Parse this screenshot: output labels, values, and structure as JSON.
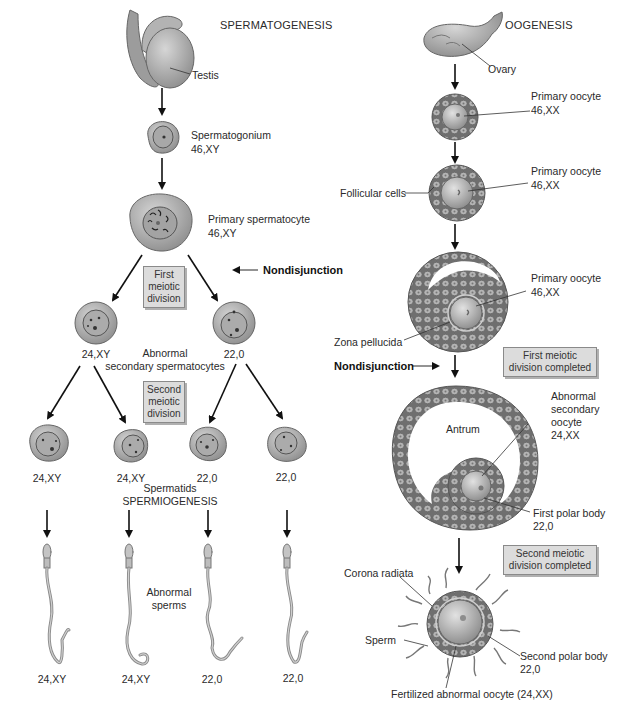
{
  "spermatogenesis": {
    "title": "SPERMATOGENESIS",
    "testis_label": "Testis",
    "spermatogonium": {
      "name": "Spermatogonium",
      "karyotype": "46,XY"
    },
    "primary_spermatocyte": {
      "name": "Primary spermatocyte",
      "karyotype": "46,XY"
    },
    "first_division_box": [
      "First",
      "meiotic",
      "division"
    ],
    "nondisjunction_label": "Nondisjunction",
    "secondary_spermatocytes": {
      "label_line1": "Abnormal",
      "label_line2": "secondary spermatocytes",
      "karyotypes": [
        "24,XY",
        "22,0"
      ]
    },
    "second_division_box": [
      "Second",
      "meiotic",
      "division"
    ],
    "spermatids": {
      "karyotypes": [
        "24,XY",
        "24,XY",
        "22,0",
        "22,0"
      ],
      "label": "Spermatids",
      "process_label": "SPERMIOGENESIS"
    },
    "sperms": {
      "label_line1": "Abnormal",
      "label_line2": "sperms",
      "karyotypes": [
        "24,XY",
        "24,XY",
        "22,0",
        "22,0"
      ]
    }
  },
  "oogenesis": {
    "title": "OOGENESIS",
    "ovary_label": "Ovary",
    "primary_oocyte_1": {
      "name": "Primary oocyte",
      "karyotype": "46,XX"
    },
    "primary_oocyte_2": {
      "name": "Primary oocyte",
      "karyotype": "46,XX"
    },
    "follicular_cells_label": "Follicular cells",
    "primary_oocyte_3": {
      "name": "Primary oocyte",
      "karyotype": "46,XX"
    },
    "zona_pellucida_label": "Zona pellucida",
    "nondisjunction_label": "Nondisjunction",
    "first_division_box": [
      "First meiotic",
      "division completed"
    ],
    "antrum_label": "Antrum",
    "secondary_oocyte": {
      "line1": "Abnormal",
      "line2": "secondary",
      "line3": "oocyte",
      "karyotype": "24,XX"
    },
    "first_polar_body": {
      "name": "First polar body",
      "karyotype": "22,0"
    },
    "second_division_box": [
      "Second meiotic",
      "division completed"
    ],
    "corona_radiata_label": "Corona radiata",
    "sperm_label": "Sperm",
    "second_polar_body": {
      "name": "Second polar body",
      "karyotype": "22,0"
    },
    "fertilized_label": "Fertilized abnormal oocyte (24,XX)"
  },
  "colors": {
    "cell_fill": "#b8b8b8",
    "cell_dark": "#8c8c8c",
    "nucleus_fill": "#a9a9a9",
    "box_fill": "#dcdcdc",
    "follicle_fill": "#9a9a9a",
    "arrow": "#111111"
  }
}
